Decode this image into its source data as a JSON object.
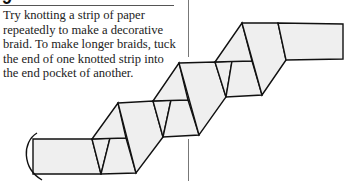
{
  "page": {
    "heading_fragment": "9",
    "body_lines": [
      "Try knotting a strip of paper",
      "repeatedly to make a decorative",
      "braid. To make longer braids, tuck",
      "the end of one knotted strip into",
      "the end pocket of another."
    ]
  },
  "diagram": {
    "fill_color": "#efefef",
    "stroke_color": "#111111"
  }
}
